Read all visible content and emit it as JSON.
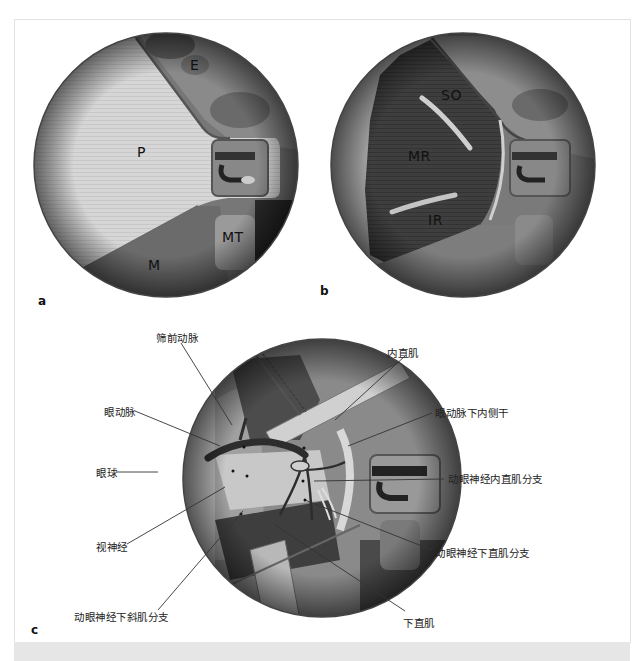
{
  "figure": {
    "panels": [
      {
        "id": "a",
        "letter": "a",
        "labels": {
          "E": "E",
          "P": "P",
          "MT": "MT",
          "M": "M"
        }
      },
      {
        "id": "b",
        "letter": "b",
        "labels": {
          "SO": "SO",
          "MR": "MR",
          "IR": "IR"
        }
      },
      {
        "id": "c",
        "letter": "c",
        "callouts": {
          "anterior_ethmoidal_artery": "筛前动脉",
          "ophthalmic_artery": "眼动脉",
          "eyeball": "眼球",
          "optic_nerve": "视神经",
          "oculomotor_inferior_oblique_branch": "动眼神经下斜肌分支",
          "medial_rectus": "内直肌",
          "ophthalmic_inferomedial_trunk": "眼动脉下内侧干",
          "oculomotor_medial_rectus_branch": "动眼神经内直肌分支",
          "oculomotor_inferior_rectus_branch": "动眼神经下直肌分支",
          "inferior_rectus": "下直肌"
        }
      }
    ]
  },
  "colors": {
    "frame_border": "#e2e2e2",
    "bottom_band": "#e6e6e6",
    "periorbita_light": "#d8d8d8",
    "tissue_dark": "#3a3a3a",
    "leader_line": "#333333"
  }
}
